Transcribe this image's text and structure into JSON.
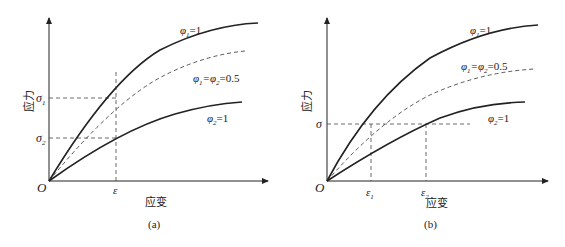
{
  "panels": [
    {
      "id": "a",
      "caption": "(a)",
      "ylabel": "应力",
      "xlabel": "应变",
      "origin_label": "O",
      "x_ticks": [
        {
          "label": "ε",
          "sub": ""
        }
      ],
      "y_ticks": [
        {
          "label": "σ",
          "sub": "1"
        },
        {
          "label": "σ",
          "sub": "2"
        }
      ],
      "curves": [
        {
          "name": "phi1",
          "style": "solid",
          "label": "φ₁=1"
        },
        {
          "name": "phi12",
          "style": "dashed",
          "label": "φ₁=φ₂=0.5"
        },
        {
          "name": "phi2",
          "style": "solid",
          "label": "φ₂=1"
        }
      ]
    },
    {
      "id": "b",
      "caption": "(b)",
      "ylabel": "应力",
      "xlabel": "应变",
      "origin_label": "O",
      "x_ticks": [
        {
          "label": "ε",
          "sub": "1"
        },
        {
          "label": "ε",
          "sub": "2"
        }
      ],
      "y_ticks": [
        {
          "label": "σ",
          "sub": ""
        }
      ],
      "curves": [
        {
          "name": "phi1",
          "style": "solid",
          "label": "φ₁=1"
        },
        {
          "name": "phi12",
          "style": "dashed",
          "label": "φ₁=φ₂=0.5"
        },
        {
          "name": "phi2",
          "style": "solid",
          "label": "φ₂=1"
        }
      ]
    }
  ],
  "labels": {
    "a_phi1": "φ",
    "a_phi1_sub": "1",
    "a_phi1_val": "=1",
    "a_mix_1": "φ",
    "a_mix_1_sub": "1",
    "a_mix_2": "=φ",
    "a_mix_2_sub": "2",
    "a_mix_val": "=0.5",
    "a_phi2": "φ",
    "a_phi2_sub": "2",
    "a_phi2_val": "=1",
    "b_phi1": "φ",
    "b_phi1_sub": "1",
    "b_phi1_val": "=1",
    "b_mix_1": "φ",
    "b_mix_1_sub": "1",
    "b_mix_2": "=φ",
    "b_mix_2_sub": "2",
    "b_mix_val": "=0.5",
    "b_phi2": "φ",
    "b_phi2_sub": "2",
    "b_phi2_val": "=1",
    "sigma": "σ",
    "eps": "ε",
    "sub1": "1",
    "sub2": "2",
    "origin": "O",
    "ylabel": "应力",
    "xlabel": "应变",
    "cap_a": "(a)",
    "cap_b": "(b)"
  },
  "colors": {
    "line": "#222222",
    "dash": "#444444",
    "background": "#ffffff"
  }
}
